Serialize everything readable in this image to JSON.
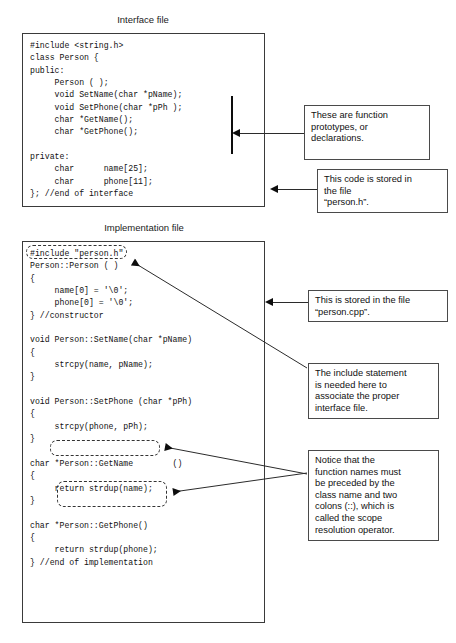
{
  "diagram": {
    "sections": [
      {
        "caption": "Interface file",
        "code": "#include <string.h>\nclass Person {\npublic:\n     Person ( );\n     void SetName(char *pName);\n     void SetPhone(char *pPh );\n     char *GetName();\n     char *GetPhone();\n\nprivate:\n     char      name[25];\n     char      phone[11];\n}; //end of interface"
      },
      {
        "caption": "Implementation file",
        "code": "#include \"person.h\"\nPerson::Person ( )\n{\n     name[0] = '\\0';\n     phone[0] = '\\0';\n} //constructor\n\nvoid Person::SetName(char *pName)\n{\n     strcpy(name, pName);\n}\n\nvoid Person::SetPhone (char *pPh)\n{\n     strcpy(phone, pPh);\n}\n\nchar *Person::GetName        ()\n{\n     return strdup(name);\n}\n\nchar *Person::GetPhone()\n{\n     return strdup(phone);\n} //end of implementation"
      }
    ],
    "callouts": [
      {
        "id": "function-prototypes",
        "lines": [
          "These are function",
          "prototypes, or",
          "declarations."
        ]
      },
      {
        "id": "stored-in-person-h",
        "lines": [
          "This code is stored in",
          "the file",
          "“person.h”."
        ]
      },
      {
        "id": "stored-in-person-cpp",
        "lines": [
          "This is stored in the file",
          "“person.cpp”."
        ]
      },
      {
        "id": "include-statement",
        "lines": [
          "The include statement",
          "is needed here to",
          "associate the proper",
          "interface file."
        ]
      },
      {
        "id": "scope-resolution",
        "lines": [
          "Notice that the",
          "function names must",
          "be preceded by the",
          "class name and two",
          "colons (::), which  is",
          "called the scope",
          "resolution operator."
        ]
      }
    ],
    "highlights": [
      {
        "id": "include-person-h-highlight",
        "label": "#include \"person.h\""
      },
      {
        "id": "setphone-name-highlight",
        "label": "Person::SetPhone (char"
      },
      {
        "id": "getname-name-highlight",
        "label": "*Person::GetName"
      }
    ],
    "colors": {
      "stroke": "#2b2b2b",
      "frame": "#3a3a3a",
      "text": "#111111",
      "background": "#ffffff"
    }
  }
}
